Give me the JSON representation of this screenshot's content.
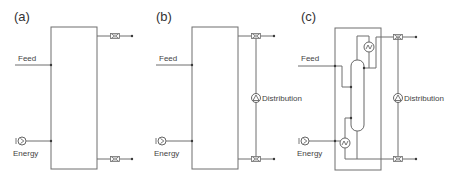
{
  "panels": [
    {
      "id": "a",
      "label": "(a)",
      "feed_label": "Feed",
      "energy_label": "Energy"
    },
    {
      "id": "b",
      "label": "(b)",
      "feed_label": "Feed",
      "energy_label": "Energy",
      "distribution_label": "Distribution"
    },
    {
      "id": "c",
      "label": "(c)",
      "feed_label": "Feed",
      "energy_label": "Energy",
      "distribution_label": "Distribution"
    }
  ],
  "colors": {
    "line": "#6e6e6e",
    "text": "#333333",
    "background": "#ffffff"
  },
  "icons": {
    "energy": "energy-source-icon",
    "valve": "valve-icon",
    "pump": "distribution-pump-icon",
    "condenser": "condenser-icon",
    "reboiler": "reboiler-icon",
    "column": "distillation-column-icon"
  }
}
